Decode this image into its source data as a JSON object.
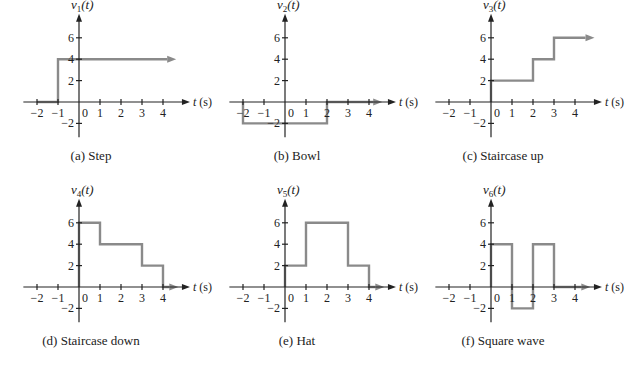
{
  "figure": {
    "panels": [
      {
        "id": "a",
        "ylabel_base": "v",
        "ylabel_sub": "1",
        "ylabel_arg": "(t)",
        "xlabel": "t (s)",
        "caption": "(a) Step"
      },
      {
        "id": "b",
        "ylabel_base": "v",
        "ylabel_sub": "2",
        "ylabel_arg": "(t)",
        "xlabel": "t (s)",
        "caption": "(b) Bowl"
      },
      {
        "id": "c",
        "ylabel_base": "v",
        "ylabel_sub": "3",
        "ylabel_arg": "(t)",
        "xlabel": "t (s)",
        "caption": "(c) Staircase up"
      },
      {
        "id": "d",
        "ylabel_base": "v",
        "ylabel_sub": "4",
        "ylabel_arg": "(t)",
        "xlabel": "t (s)",
        "caption": "(d) Staircase down"
      },
      {
        "id": "e",
        "ylabel_base": "v",
        "ylabel_sub": "5",
        "ylabel_arg": "(t)",
        "xlabel": "t (s)",
        "caption": "(e) Hat"
      },
      {
        "id": "f",
        "ylabel_base": "v",
        "ylabel_sub": "6",
        "ylabel_arg": "(t)",
        "xlabel": "t (s)",
        "caption": "(f) Square wave"
      }
    ],
    "x_ticks": [
      "−2",
      "−1",
      "0",
      "1",
      "2",
      "3",
      "4"
    ],
    "y_ticks": [
      "6",
      "4",
      "2",
      "−2"
    ]
  },
  "chart_data": [
    {
      "type": "line",
      "title": "(a) Step",
      "xlabel": "t (s)",
      "ylabel": "v1(t)",
      "x": [
        -2,
        -1,
        -1,
        4.2
      ],
      "y": [
        0,
        0,
        4,
        4
      ],
      "continues_right": true,
      "xlim": [
        -2.5,
        4.8
      ],
      "ylim": [
        -3,
        7
      ],
      "xticks": [
        -2,
        -1,
        0,
        1,
        2,
        3,
        4
      ],
      "yticks": [
        -2,
        2,
        4,
        6
      ]
    },
    {
      "type": "line",
      "title": "(b) Bowl",
      "xlabel": "t (s)",
      "ylabel": "v2(t)",
      "x": [
        -2,
        -2,
        2,
        2,
        4.2
      ],
      "y": [
        0,
        -2,
        -2,
        0,
        0
      ],
      "continues_right": true,
      "xlim": [
        -2.5,
        4.8
      ],
      "ylim": [
        -3,
        7
      ],
      "xticks": [
        -2,
        -1,
        0,
        1,
        2,
        3,
        4
      ],
      "yticks": [
        -2,
        2,
        4,
        6
      ]
    },
    {
      "type": "line",
      "title": "(c) Staircase up",
      "xlabel": "t (s)",
      "ylabel": "v3(t)",
      "x": [
        0,
        0,
        2,
        2,
        3,
        3,
        4.5
      ],
      "y": [
        0,
        2,
        2,
        4,
        4,
        6,
        6
      ],
      "continues_right": true,
      "xlim": [
        -2.5,
        4.8
      ],
      "ylim": [
        -3,
        7
      ],
      "xticks": [
        -2,
        -1,
        0,
        1,
        2,
        3,
        4
      ],
      "yticks": [
        -2,
        2,
        4,
        6
      ]
    },
    {
      "type": "line",
      "title": "(d) Staircase down",
      "xlabel": "t (s)",
      "ylabel": "v4(t)",
      "x": [
        0,
        0,
        1,
        1,
        3,
        3,
        4,
        4,
        4.3
      ],
      "y": [
        0,
        6,
        6,
        4,
        4,
        2,
        2,
        0,
        0
      ],
      "continues_right": true,
      "xlim": [
        -2.5,
        4.8
      ],
      "ylim": [
        -3,
        7
      ],
      "xticks": [
        -2,
        -1,
        0,
        1,
        2,
        3,
        4
      ],
      "yticks": [
        -2,
        2,
        4,
        6
      ]
    },
    {
      "type": "line",
      "title": "(e) Hat",
      "xlabel": "t (s)",
      "ylabel": "v5(t)",
      "x": [
        0,
        0,
        1,
        1,
        3,
        3,
        4,
        4,
        4.3
      ],
      "y": [
        0,
        2,
        2,
        6,
        6,
        2,
        2,
        0,
        0
      ],
      "continues_right": true,
      "xlim": [
        -2.5,
        4.8
      ],
      "ylim": [
        -3,
        7
      ],
      "xticks": [
        -2,
        -1,
        0,
        1,
        2,
        3,
        4
      ],
      "yticks": [
        -2,
        2,
        4,
        6
      ]
    },
    {
      "type": "line",
      "title": "(f) Square wave",
      "xlabel": "t (s)",
      "ylabel": "v6(t)",
      "x": [
        0,
        0,
        1,
        1,
        2,
        2,
        3,
        3,
        4.3
      ],
      "y": [
        0,
        4,
        4,
        -2,
        -2,
        4,
        4,
        0,
        0
      ],
      "continues_right": true,
      "xlim": [
        -2.5,
        4.8
      ],
      "ylim": [
        -3,
        7
      ],
      "xticks": [
        -2,
        -1,
        0,
        1,
        2,
        3,
        4
      ],
      "yticks": [
        -2,
        2,
        4,
        6
      ]
    }
  ]
}
